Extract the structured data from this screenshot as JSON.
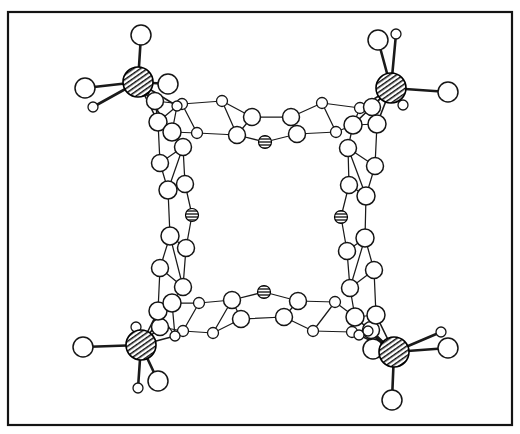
{
  "figure": {
    "caption": "",
    "background_color": "#ffffff",
    "frame": {
      "present": true,
      "color": "#141414",
      "x": 8,
      "y": 12,
      "width": 504,
      "height": 413,
      "stroke_width": 2.2
    }
  },
  "style": {
    "bond_color": "#1a1a1a",
    "atom_outline_color": "#151515",
    "atom_open_fill": "#ffffff",
    "metal_fill_pattern": "diagonal-hatch",
    "metal_fill_color": "#111111",
    "hetero_fill_pattern": "horizontal-stripe",
    "hetero_fill_color": "#4a4a4a"
  },
  "chart_data": {
    "type": "scatter",
    "xlabel": "",
    "ylabel": "",
    "grid": false,
    "legend": "none",
    "xlim": [
      0,
      520
    ],
    "ylim": [
      0,
      434
    ],
    "atom_types": [
      {
        "key": "metal",
        "label": "metal-center",
        "radius": 15,
        "fill": "diagonal-hatch",
        "count": 4
      },
      {
        "key": "hetero",
        "label": "bridging-heteroatom",
        "radius": 6.5,
        "fill": "horizontal-stripe",
        "count": 4
      },
      {
        "key": "ring_large",
        "label": "ring-atom-large",
        "radius": 8.5,
        "fill": "open",
        "count": 52
      },
      {
        "key": "ring_small",
        "label": "ring-atom-small",
        "radius": 5.5,
        "fill": "open",
        "count": 26
      },
      {
        "key": "ligand_large",
        "label": "terminal-ligand-large",
        "radius": 10,
        "fill": "open",
        "count": 12
      },
      {
        "key": "ligand_small",
        "label": "terminal-ligand-small",
        "radius": 4.5,
        "fill": "open",
        "count": 8
      }
    ],
    "metals": [
      {
        "id": "M1",
        "x": 138,
        "y": 82,
        "r": 15
      },
      {
        "id": "M2",
        "x": 391,
        "y": 88,
        "r": 15
      },
      {
        "id": "M3",
        "x": 141,
        "y": 345,
        "r": 15
      },
      {
        "id": "M4",
        "x": 394,
        "y": 352,
        "r": 15
      }
    ],
    "heteroatoms": [
      {
        "id": "X1",
        "x": 265,
        "y": 142,
        "r": 6.5,
        "edge": "top"
      },
      {
        "id": "X2",
        "x": 192,
        "y": 215,
        "r": 6.5,
        "edge": "left"
      },
      {
        "id": "X3",
        "x": 341,
        "y": 217,
        "r": 6.5,
        "edge": "right"
      },
      {
        "id": "X4",
        "x": 264,
        "y": 292,
        "r": 6.5,
        "edge": "bottom"
      }
    ],
    "terminal_ligands": [
      {
        "metal": "M1",
        "x": 141,
        "y": 35,
        "r": 10,
        "size": "large"
      },
      {
        "metal": "M1",
        "x": 85,
        "y": 88,
        "r": 10,
        "size": "large"
      },
      {
        "metal": "M1",
        "x": 168,
        "y": 84,
        "r": 10,
        "size": "large"
      },
      {
        "metal": "M1",
        "x": 93,
        "y": 107,
        "r": 5,
        "size": "small"
      },
      {
        "metal": "M2",
        "x": 378,
        "y": 40,
        "r": 10,
        "size": "large"
      },
      {
        "metal": "M2",
        "x": 396,
        "y": 34,
        "r": 5,
        "size": "small"
      },
      {
        "metal": "M2",
        "x": 448,
        "y": 92,
        "r": 10,
        "size": "large"
      },
      {
        "metal": "M2",
        "x": 403,
        "y": 105,
        "r": 5,
        "size": "small"
      },
      {
        "metal": "M3",
        "x": 83,
        "y": 347,
        "r": 10,
        "size": "large"
      },
      {
        "metal": "M3",
        "x": 138,
        "y": 388,
        "r": 5,
        "size": "small"
      },
      {
        "metal": "M3",
        "x": 158,
        "y": 381,
        "r": 10,
        "size": "large"
      },
      {
        "metal": "M3",
        "x": 136,
        "y": 327,
        "r": 5,
        "size": "small"
      },
      {
        "metal": "M4",
        "x": 441,
        "y": 332,
        "r": 5,
        "size": "small"
      },
      {
        "metal": "M4",
        "x": 448,
        "y": 348,
        "r": 10,
        "size": "large"
      },
      {
        "metal": "M4",
        "x": 373,
        "y": 349,
        "r": 10,
        "size": "large"
      },
      {
        "metal": "M4",
        "x": 392,
        "y": 400,
        "r": 10,
        "size": "large"
      },
      {
        "metal": "M4",
        "x": 368,
        "y": 331,
        "r": 5,
        "size": "small"
      }
    ],
    "symmetry": "approximate 4-fold (S4 / D4) about the cavity center",
    "cavity": {
      "center_x": 264,
      "center_y": 217,
      "approx_width": 150,
      "approx_height": 150
    }
  }
}
